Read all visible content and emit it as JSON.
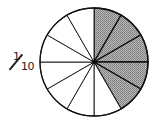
{
  "label": {
    "numerator": "1",
    "denominator": "10",
    "text": "1/10"
  },
  "pie": {
    "total_slices": 12,
    "shaded_slices": 5,
    "shaded_start": "12 o'clock, clockwise",
    "fill_shaded": "#9a9a9a",
    "fill_unshaded": "#ffffff",
    "stroke": "#111111",
    "center": [
      94,
      62
    ],
    "radius": 54
  }
}
